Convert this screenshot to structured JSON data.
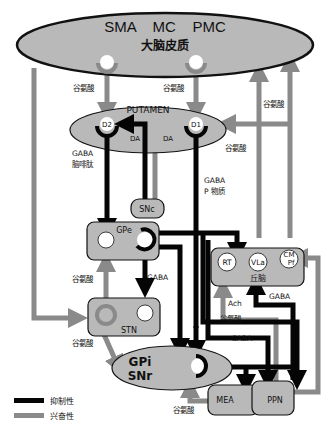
{
  "colors": {
    "inhibitory": "#050505",
    "excitatory": "#8a8a8a",
    "nucleus_fill": "#b9b9b9",
    "outline": "#111111",
    "background": "#ffffff",
    "cell_fill": "#ffffff"
  },
  "cortex": {
    "areas": [
      "SMA",
      "MC",
      "PMC"
    ],
    "area_line": "SMA    MC    PMC",
    "name": "大脑皮质"
  },
  "putamen": {
    "name": "PUTAMEN",
    "d2": "D2",
    "d1": "D1",
    "da_left": "DA",
    "da_right": "DA"
  },
  "nuclei": {
    "snc": "SNc",
    "gpe": "GPe",
    "stn": "STN",
    "gpi_snr_line1": "GPi",
    "gpi_snr_line2": "SNr",
    "thalamus": "丘脑",
    "rt": "RT",
    "vla": "VLa",
    "cm_pf_line1": "CM",
    "cm_pf_line2": "Pf",
    "mea": "MEA",
    "ppn": "PPN"
  },
  "labels": {
    "glu_cortex_left": "谷氨酸",
    "glu_cortex_right": "谷氨酸",
    "glu_to_cortex": "谷氨酸",
    "glu_thal_putamen": "谷氨酸",
    "gaba_enk_line1": "GABA",
    "gaba_enk_line2": "脑啡肽",
    "gaba_sp_line1": "GABA",
    "gaba_sp_line2": "P 物质",
    "gaba_gpe_stn": "GABA",
    "glu_stn_gpe": "谷氨酸",
    "glu_stn_gpi": "谷氨酸",
    "ach": "Ach",
    "glu_ppn_thal": "谷氨酸",
    "gaba_ppn_vla": "GABA",
    "gaba_gpi_out": "GABA",
    "glu_mea_gpi": "谷氨酸"
  },
  "legend": {
    "items": [
      {
        "label": "抑制性",
        "type": "inhibitory"
      },
      {
        "label": "兴奋性",
        "type": "excitatory"
      }
    ]
  }
}
